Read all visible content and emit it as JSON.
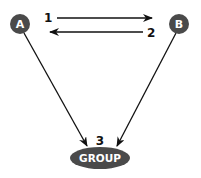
{
  "diagram": {
    "nodes": [
      {
        "id": "A",
        "label": "A",
        "shape": "circle"
      },
      {
        "id": "B",
        "label": "B",
        "shape": "circle"
      },
      {
        "id": "GROUP",
        "label": "GROUP",
        "shape": "ellipse"
      }
    ],
    "edges": [
      {
        "from": "A",
        "to": "B",
        "label": "1"
      },
      {
        "from": "B",
        "to": "A",
        "label": "2"
      },
      {
        "from": "A",
        "to": "GROUP",
        "label": ""
      },
      {
        "from": "B",
        "to": "GROUP",
        "label": ""
      }
    ],
    "group_step_label": "3"
  },
  "colors": {
    "node_fill": "#4a4a4a",
    "node_text": "#ffffff",
    "line": "#111111",
    "background": "#ffffff"
  }
}
